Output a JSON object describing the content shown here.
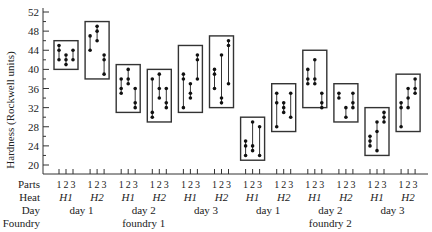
{
  "chart_data": {
    "type": "scatter",
    "title": "",
    "ylabel": "Hardness (Rockwell units)",
    "ylim": [
      20,
      52
    ],
    "yticks": [
      20,
      24,
      28,
      32,
      36,
      40,
      44,
      48,
      52
    ],
    "row_labels": [
      "Parts",
      "Heat",
      "Day",
      "Foundry"
    ],
    "part_labels": [
      "1",
      "2",
      "3"
    ],
    "groups": [
      {
        "foundry": "foundry 1",
        "day": "day 1",
        "heat": "H1",
        "box": [
          40,
          46
        ],
        "parts": [
          [
            45,
            44,
            42
          ],
          [
            43,
            42,
            41
          ],
          [
            44,
            42
          ]
        ]
      },
      {
        "foundry": "foundry 1",
        "day": "day 1",
        "heat": "H2",
        "box": [
          38,
          50
        ],
        "parts": [
          [
            47,
            44
          ],
          [
            49,
            48,
            46
          ],
          [
            43,
            42,
            39
          ]
        ]
      },
      {
        "foundry": "foundry 1",
        "day": "day 2",
        "heat": "H1",
        "box": [
          31,
          41
        ],
        "parts": [
          [
            38,
            36,
            35
          ],
          [
            40,
            38,
            37
          ],
          [
            36,
            33,
            32
          ]
        ]
      },
      {
        "foundry": "foundry 1",
        "day": "day 2",
        "heat": "H2",
        "box": [
          29,
          40
        ],
        "parts": [
          [
            38,
            31,
            30
          ],
          [
            39,
            36,
            34
          ],
          [
            36,
            33,
            32
          ]
        ]
      },
      {
        "foundry": "foundry 1",
        "day": "day 3",
        "heat": "H1",
        "box": [
          31,
          45
        ],
        "parts": [
          [
            39,
            38,
            32
          ],
          [
            37,
            35,
            34
          ],
          [
            43,
            42,
            38
          ]
        ]
      },
      {
        "foundry": "foundry 1",
        "day": "day 3",
        "heat": "H2",
        "box": [
          32,
          47
        ],
        "parts": [
          [
            40,
            39,
            36
          ],
          [
            43,
            34,
            33
          ],
          [
            46,
            45,
            37
          ]
        ]
      },
      {
        "foundry": "foundry 2",
        "day": "day 1",
        "heat": "H1",
        "box": [
          21,
          30
        ],
        "parts": [
          [
            25,
            24,
            22
          ],
          [
            29,
            24,
            23
          ],
          [
            28,
            22
          ]
        ]
      },
      {
        "foundry": "foundry 2",
        "day": "day 1",
        "heat": "H2",
        "box": [
          27,
          37
        ],
        "parts": [
          [
            35,
            33,
            28
          ],
          [
            33,
            32,
            31
          ],
          [
            35,
            30
          ]
        ]
      },
      {
        "foundry": "foundry 2",
        "day": "day 2",
        "heat": "H1",
        "box": [
          32,
          44
        ],
        "parts": [
          [
            40,
            38,
            37
          ],
          [
            42,
            38,
            37
          ],
          [
            35,
            33,
            32
          ]
        ]
      },
      {
        "foundry": "foundry 2",
        "day": "day 2",
        "heat": "H2",
        "box": [
          29,
          37
        ],
        "parts": [
          [
            35,
            34
          ],
          [
            32,
            30
          ],
          [
            35,
            33,
            32
          ]
        ]
      },
      {
        "foundry": "foundry 2",
        "day": "day 3",
        "heat": "H1",
        "box": [
          22,
          32
        ],
        "parts": [
          [
            26,
            25,
            24
          ],
          [
            29,
            27,
            23
          ],
          [
            31,
            30,
            29
          ]
        ]
      },
      {
        "foundry": "foundry 2",
        "day": "day 3",
        "heat": "H2",
        "box": [
          27,
          39
        ],
        "parts": [
          [
            33,
            32,
            28
          ],
          [
            36,
            34,
            32
          ],
          [
            38,
            36,
            35
          ]
        ]
      }
    ],
    "days": [
      {
        "label": "day 1"
      },
      {
        "label": "day 2"
      },
      {
        "label": "day 3"
      },
      {
        "label": "day 1"
      },
      {
        "label": "day 2"
      },
      {
        "label": "day 3"
      }
    ],
    "foundries": [
      {
        "label": "foundry 1"
      },
      {
        "label": "foundry 2"
      }
    ],
    "grid": false,
    "legend": "none"
  }
}
